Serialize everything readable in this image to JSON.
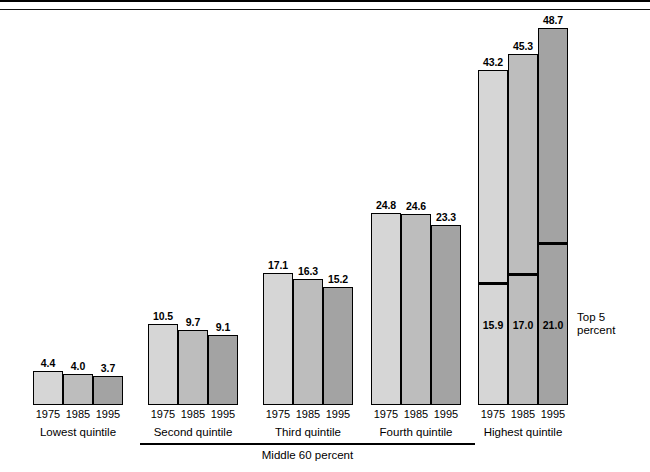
{
  "figure": {
    "title_clipped": "Share of Aggregate Income Received by Each Fifth of Households (Percent)",
    "middle_bracket_label": "Middle 60 percent",
    "top5_annotation_line1": "Top 5",
    "top5_annotation_line2": "percent"
  },
  "colors": {
    "y1975": "#d6d6d6",
    "y1985": "#bdbdbd",
    "y1995": "#a3a3a3",
    "outline": "#000000",
    "background": "#ffffff"
  },
  "chart_data": {
    "type": "bar",
    "title": "Share of Aggregate Income Received by Each Fifth of Households (Percent)",
    "xlabel": "",
    "ylabel": "",
    "ylim": [
      0,
      50
    ],
    "grid": false,
    "legend": "none",
    "categories": [
      "Lowest quintile",
      "Second quintile",
      "Third quintile",
      "Fourth quintile",
      "Highest quintile"
    ],
    "series": [
      {
        "name": "1975",
        "values": [
          4.4,
          10.5,
          17.1,
          24.8,
          43.2
        ]
      },
      {
        "name": "1985",
        "values": [
          4.0,
          9.7,
          16.3,
          24.6,
          45.3
        ]
      },
      {
        "name": "1995",
        "values": [
          3.7,
          9.1,
          15.2,
          23.3,
          48.7
        ]
      }
    ],
    "annotations": {
      "top_5_percent": {
        "label": "Top 5 percent",
        "applies_to_category": "Highest quintile",
        "values": {
          "1975": 15.9,
          "1985": 17.0,
          "1995": 21.0
        }
      },
      "middle_60_percent": {
        "label": "Middle 60 percent",
        "spans_categories": [
          "Second quintile",
          "Third quintile",
          "Fourth quintile"
        ]
      }
    }
  },
  "groups": [
    {
      "label": "Lowest quintile",
      "bars": [
        {
          "year": "1975",
          "value": "4.4"
        },
        {
          "year": "1985",
          "value": "4.0"
        },
        {
          "year": "1995",
          "value": "3.7"
        }
      ]
    },
    {
      "label": "Second quintile",
      "bars": [
        {
          "year": "1975",
          "value": "10.5"
        },
        {
          "year": "1985",
          "value": "9.7"
        },
        {
          "year": "1995",
          "value": "9.1"
        }
      ]
    },
    {
      "label": "Third quintile",
      "bars": [
        {
          "year": "1975",
          "value": "17.1"
        },
        {
          "year": "1985",
          "value": "16.3"
        },
        {
          "year": "1995",
          "value": "15.2"
        }
      ]
    },
    {
      "label": "Fourth quintile",
      "bars": [
        {
          "year": "1975",
          "value": "24.8"
        },
        {
          "year": "1985",
          "value": "24.6"
        },
        {
          "year": "1995",
          "value": "23.3"
        }
      ]
    },
    {
      "label": "Highest quintile",
      "bars": [
        {
          "year": "1975",
          "value": "43.2"
        },
        {
          "year": "1985",
          "value": "45.3"
        },
        {
          "year": "1995",
          "value": "48.7"
        }
      ],
      "segments": [
        {
          "year": "1975",
          "value": "15.9"
        },
        {
          "year": "1985",
          "value": "17.0"
        },
        {
          "year": "1995",
          "value": "21.0"
        }
      ]
    }
  ]
}
